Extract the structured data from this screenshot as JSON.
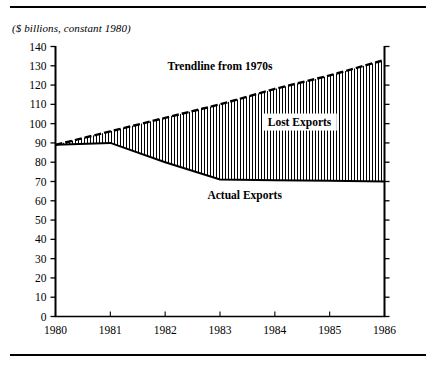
{
  "figure": {
    "subtitle": "($ billions, constant 1980)",
    "has_top_rule": true,
    "has_bottom_rule": true,
    "rule_color": "#000000"
  },
  "chart_data": {
    "type": "area",
    "title": "",
    "subtitle": "($ billions, constant 1980)",
    "xlabel": "",
    "ylabel": "",
    "x": [
      1980,
      1981,
      1982,
      1983,
      1984,
      1985,
      1986
    ],
    "xlim": [
      1980,
      1986
    ],
    "ylim": [
      0,
      140
    ],
    "grid": false,
    "legend_position": "inline-annotations",
    "xticks": [
      "1980",
      "1981",
      "1982",
      "1983",
      "1984",
      "1985",
      "1986"
    ],
    "yticks": [
      "0",
      "10",
      "20",
      "30",
      "40",
      "50",
      "60",
      "70",
      "80",
      "90",
      "100",
      "110",
      "120",
      "130",
      "140"
    ],
    "ytick_values": [
      0,
      10,
      20,
      30,
      40,
      50,
      60,
      70,
      80,
      90,
      100,
      110,
      120,
      130,
      140
    ],
    "series": [
      {
        "name": "Trendline from 1970s",
        "style": "dashed",
        "color": "#000000",
        "values": [
          89,
          96,
          103,
          110,
          118,
          125,
          133
        ]
      },
      {
        "name": "Actual Exports",
        "style": "solid",
        "color": "#000000",
        "values": [
          89,
          90,
          80,
          71,
          70.7,
          70.4,
          70
        ]
      }
    ],
    "fill": {
      "name": "Lost Exports",
      "between": [
        "Trendline from 1970s",
        "Actual Exports"
      ],
      "pattern": "vertical-hatch",
      "color": "#000000"
    },
    "annotations": [
      {
        "name": "trendline-label",
        "text": "Trendline from 1970s",
        "x": 1983.0,
        "y": 128
      },
      {
        "name": "lost-exports-label",
        "text": "Lost Exports",
        "x": 1984.45,
        "y": 99
      },
      {
        "name": "actual-exports-label",
        "text": "Actual Exports",
        "x": 1983.45,
        "y": 61
      }
    ]
  }
}
